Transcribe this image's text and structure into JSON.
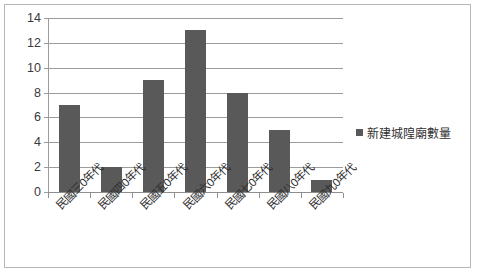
{
  "chart_data": {
    "type": "bar",
    "title": "",
    "xlabel": "",
    "ylabel": "",
    "categories": [
      "民國三0年代",
      "民國四0年代",
      "民國五0年代",
      "民國六0年代",
      "民國七0年代",
      "民國八0年代",
      "民國九0年代"
    ],
    "series": [
      {
        "name": "新建城隍廟數量",
        "values": [
          7,
          2,
          9,
          13,
          8,
          5,
          1
        ]
      }
    ],
    "values": [
      7,
      2,
      9,
      13,
      8,
      5,
      1
    ],
    "ylim": [
      0,
      14
    ],
    "ytick_step": 2,
    "yticks": [
      0,
      2,
      4,
      6,
      8,
      10,
      12,
      14
    ],
    "ytick_labels": [
      "0",
      "2",
      "4",
      "6",
      "8",
      "10",
      "12",
      "14"
    ],
    "grid": true,
    "grid_axis": "y",
    "legend": {
      "position": "right",
      "entries": [
        "新建城隍廟數量"
      ]
    },
    "colors": {
      "bar": "#595959",
      "gridline": "#9c9c9c",
      "axis": "#8f8f8f",
      "border": "#b6b6b6",
      "text": "#2f2f2f",
      "background": "#ffffff"
    },
    "xtick_rotation": -45
  }
}
